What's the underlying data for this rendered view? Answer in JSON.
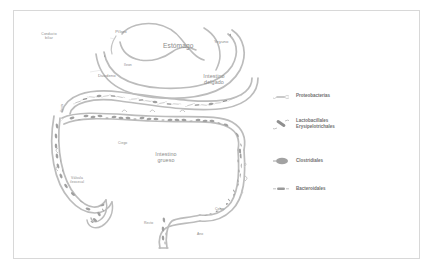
{
  "figure": {
    "background_color": "#ffffff",
    "border_color": "#d8d8d8",
    "outline_color": "#bcbcbc",
    "label_color": "#8a8a8a",
    "legend_text_color": "#6e6e6e"
  },
  "anatomy": {
    "conducto_biliar": "Conducto\nbiliar",
    "piloro": "Píloro",
    "estomago": "Estómago",
    "yeyuno": "Yeyuno",
    "duodeno": "Duodeno",
    "ileon_upper": "Íleon",
    "intestino_delgado": "Intestino\ndelgado",
    "ileon_left": "Íleon",
    "intestino_grueso": "Intestino\ngrueso",
    "valvula_ileocecal": "Válvula\nileocecal",
    "ciego": "Ciego",
    "colon": "Colon",
    "recto": "Recto",
    "ano": "Ano"
  },
  "legend": {
    "items": [
      {
        "label": "Proteobacterias",
        "icon": "flagellated-rod-icon",
        "color": "#b9b9b9"
      },
      {
        "label": "Lactobacillales\nErysipelotrichales",
        "icon": "dark-rod-icon",
        "color": "#8f8f8f"
      },
      {
        "label": "Clostridiales",
        "icon": "filled-oval-icon",
        "color": "#a2a2a2"
      },
      {
        "label": "Bacteroidales",
        "icon": "small-dash-icon",
        "color": "#9a9a9a"
      }
    ]
  }
}
